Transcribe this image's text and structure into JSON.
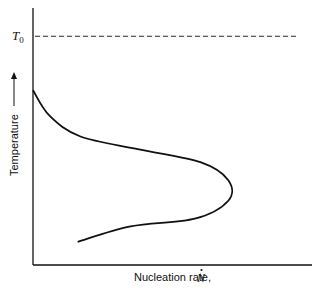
{
  "chart_data": {
    "type": "line",
    "title": "",
    "xlabel": "Nucleation rate,",
    "xlabel_symbol": "N",
    "xlabel_symbol_accent": "dot",
    "ylabel": "Temperature",
    "ylabel_arrow": "up",
    "reference_lines": [
      {
        "label": "T",
        "subscript": "0",
        "orientation": "horizontal",
        "style": "dashed",
        "y_fraction": 0.89
      }
    ],
    "curve": {
      "description": "C-shaped nucleation-rate curve: zero at T0-vicinity top, rising to a maximum at intermediate undercooling, decreasing at low temperature",
      "points": [
        {
          "x": 0.0,
          "y": 0.68
        },
        {
          "x": 0.06,
          "y": 0.58
        },
        {
          "x": 0.17,
          "y": 0.5
        },
        {
          "x": 0.38,
          "y": 0.45
        },
        {
          "x": 0.6,
          "y": 0.4
        },
        {
          "x": 0.7,
          "y": 0.33
        },
        {
          "x": 0.7,
          "y": 0.25
        },
        {
          "x": 0.58,
          "y": 0.18
        },
        {
          "x": 0.35,
          "y": 0.15
        },
        {
          "x": 0.16,
          "y": 0.09
        }
      ]
    },
    "xlim": [
      0,
      1
    ],
    "ylim": [
      0,
      1
    ],
    "grid": false
  }
}
